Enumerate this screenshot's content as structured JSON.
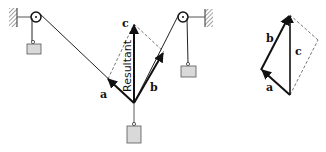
{
  "diagram": {
    "type": "force-vector-parallelogram",
    "labels": {
      "a": "a",
      "b": "b",
      "c": "c",
      "resultant": "Resultant"
    },
    "triangle_labels": {
      "a": "a",
      "b": "b",
      "c": "c"
    },
    "colors": {
      "line": "#1a1a1a",
      "weight_fill": "#d9d9d9",
      "weight_stroke": "#555555",
      "dashed": "#555555",
      "hatch": "#444444"
    }
  }
}
